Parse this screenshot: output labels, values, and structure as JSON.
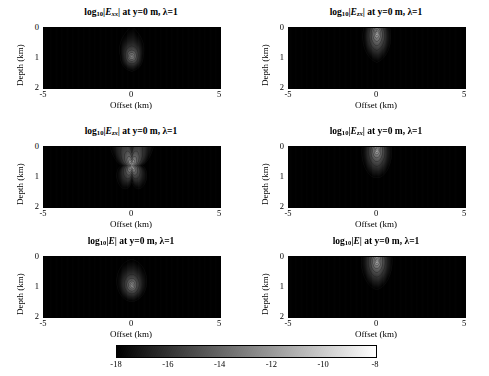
{
  "figure": {
    "type": "contour-grid",
    "rows": 3,
    "cols": 2,
    "background": "#ffffff"
  },
  "axis_labels": {
    "x": "Offset (km)",
    "y": "Depth (km)"
  },
  "axis": {
    "xlim": [
      -5,
      5
    ],
    "ylim": [
      0,
      2
    ],
    "xticks": [
      -5,
      0,
      5
    ],
    "xticklabels": [
      "-5",
      "0",
      "5"
    ],
    "yticks": [
      0,
      1,
      2
    ],
    "yticklabels": [
      "0",
      "1",
      "2"
    ],
    "y_direction": "reverse"
  },
  "colorbar": {
    "orientation": "horizontal",
    "colormap": "gray",
    "vmin": -18,
    "vmax": -8,
    "ticks": [
      -18,
      -16,
      -14,
      -12,
      -10,
      -8
    ],
    "ticklabels": [
      "-18",
      "-16",
      "-14",
      "-12",
      "-10",
      "-8"
    ]
  },
  "title_common": {
    "prefix": "log",
    "prefix_sub": "10",
    "suffix": " at y=0 m, λ=1"
  },
  "panels": [
    {
      "id": "panel-exx",
      "row": 0,
      "col": 0,
      "field": "E",
      "subscript": "xx",
      "title_text": "log10|Exx| at y=0 m, λ=1",
      "pattern": "diamond-core",
      "source_x": 0.0,
      "source_z": 0.95,
      "description": "Bright diamond-shaped core near 1 km depth at zero offset with nested lobed contours and steep lateral gradients"
    },
    {
      "id": "panel-ezx-top",
      "row": 0,
      "col": 1,
      "field": "E",
      "subscript": "zx",
      "title_text": "log10|Ezx| at y=0 m, λ=1",
      "pattern": "surface-plume",
      "source_x": 0.0,
      "source_z": 0.12,
      "description": "Bright cloverleaf plume at the surface at zero offset with a rounded lobe below and wide sweeping wings"
    },
    {
      "id": "panel-ezx-mid-left",
      "row": 1,
      "col": 0,
      "field": "E",
      "subscript": "zx",
      "title_text": "log10|Ezx| at y=0 m, λ=1",
      "pattern": "quadrupole-clover",
      "source_x": 0.0,
      "source_z": 0.62,
      "description": "Four-lobed clover with a horizontal nodal line through the bright center and stacked arc contours above and below"
    },
    {
      "id": "panel-ezx-mid-right",
      "row": 1,
      "col": 1,
      "field": "E",
      "subscript": "zx",
      "title_text": "log10|Ezx| at y=0 m, λ=1",
      "pattern": "nested-arcs",
      "source_x": 0.0,
      "source_z": 0.06,
      "description": "Bright source at the top center with nested downward-opening arcs and a narrow cusp descending below"
    },
    {
      "id": "panel-emag-left",
      "row": 2,
      "col": 0,
      "field": "E",
      "subscript": "",
      "title_text": "log10|E| at y=0 m, λ=1",
      "pattern": "concentric-ellipses",
      "source_x": 0.0,
      "source_z": 0.95,
      "description": "Smooth concentric elliptical contours around a bright core near 1 km depth with rectangular outer contours"
    },
    {
      "id": "panel-emag-right",
      "row": 2,
      "col": 1,
      "field": "E",
      "subscript": "",
      "title_text": "log10|E| at y=0 m, λ=1",
      "pattern": "surface-saddle",
      "source_x": 0.0,
      "source_z": 0.1,
      "description": "Bright compact source at the surface with hyperbolic saddle contours spreading out and downward to both sides"
    }
  ],
  "chart_data": {
    "type": "heatmap",
    "title": "",
    "xlabel": "Offset (km)",
    "ylabel": "Depth (km)",
    "xlim": [
      -5,
      5
    ],
    "ylim": [
      0,
      2
    ],
    "colorbar_label": "",
    "zlim": [
      -18,
      -8
    ],
    "grid": false,
    "legend": "none",
    "colorbar_ticks": [
      -18,
      -16,
      -14,
      -12,
      -10,
      -8
    ],
    "contour_levels": [
      -18,
      -17,
      -16,
      -15,
      -14,
      -13,
      -12,
      -11,
      -10,
      -9,
      -8
    ],
    "panels": [
      {
        "name": "log10|Exx| at y=0 m, lambda=1",
        "peak_value": -8.2,
        "peak_at": [
          0,
          0.95
        ],
        "min_value": -17.8,
        "min_at": [
          -5,
          2
        ]
      },
      {
        "name": "log10|Ezx| at y=0 m, lambda=1 (top right)",
        "peak_value": -8.4,
        "peak_at": [
          0,
          0.12
        ],
        "min_value": -15.5,
        "min_at": [
          -5,
          2
        ]
      },
      {
        "name": "log10|Ezx| at y=0 m, lambda=1 (middle left)",
        "peak_value": -8.6,
        "peak_at": [
          0,
          0.62
        ],
        "min_value": -17.5,
        "min_at": [
          -5,
          0
        ]
      },
      {
        "name": "log10|Ezx| at y=0 m, lambda=1 (middle right)",
        "peak_value": -8.3,
        "peak_at": [
          0,
          0.06
        ],
        "min_value": -15.8,
        "min_at": [
          -5,
          0
        ]
      },
      {
        "name": "log10|E| at y=0 m, lambda=1 (bottom left)",
        "peak_value": -8.1,
        "peak_at": [
          0,
          0.95
        ],
        "min_value": -16.9,
        "min_at": [
          -5,
          2
        ]
      },
      {
        "name": "log10|E| at y=0 m, lambda=1 (bottom right)",
        "peak_value": -8.2,
        "peak_at": [
          0,
          0.1
        ],
        "min_value": -15.2,
        "min_at": [
          -5,
          2
        ]
      }
    ]
  }
}
